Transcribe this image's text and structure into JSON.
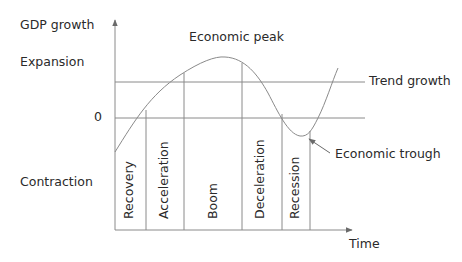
{
  "diagram": {
    "y_axis_label": "GDP growth",
    "x_axis_label": "Time",
    "regions": {
      "upper": "Expansion",
      "lower": "Contraction"
    },
    "zero_label": "0",
    "lines": {
      "trend": "Trend growth"
    },
    "annotations": {
      "peak": "Economic peak",
      "trough": "Economic trough"
    },
    "phases": [
      {
        "label": "Recovery"
      },
      {
        "label": "Acceleration"
      },
      {
        "label": "Boom"
      },
      {
        "label": "Deceleration"
      },
      {
        "label": "Recession"
      }
    ],
    "colors": {
      "line": "#8a8a8a",
      "text": "#2a2a2a",
      "background": "#ffffff"
    }
  }
}
